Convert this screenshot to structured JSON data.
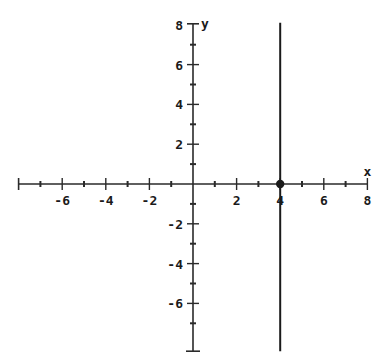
{
  "chart_data": {
    "type": "line",
    "title": "",
    "xlabel": "x",
    "ylabel": "y",
    "xlim": [
      -8,
      8
    ],
    "ylim": [
      -8,
      8
    ],
    "grid": false,
    "x_ticks": [
      -6,
      -4,
      -2,
      2,
      4,
      6,
      8
    ],
    "x_tick_labels": [
      "-6",
      "-4",
      "-2",
      "2",
      "4",
      "6",
      "8"
    ],
    "y_ticks": [
      8,
      6,
      4,
      2,
      -2,
      -4,
      -6
    ],
    "y_tick_labels": [
      "8",
      "6",
      "4",
      "2",
      "-2",
      "-4",
      "-6"
    ],
    "minor_tick_step": 1,
    "series": [
      {
        "name": "x = 4",
        "kind": "vertical-line",
        "x": [
          4,
          4
        ],
        "y": [
          -8.4,
          8.1
        ]
      }
    ],
    "points": [
      {
        "label": "(4, 0)",
        "x": 4,
        "y": 0
      }
    ]
  },
  "colors": {
    "axis": "#2a2a2a",
    "line": "#1a1a1a",
    "background": "#ffffff"
  }
}
